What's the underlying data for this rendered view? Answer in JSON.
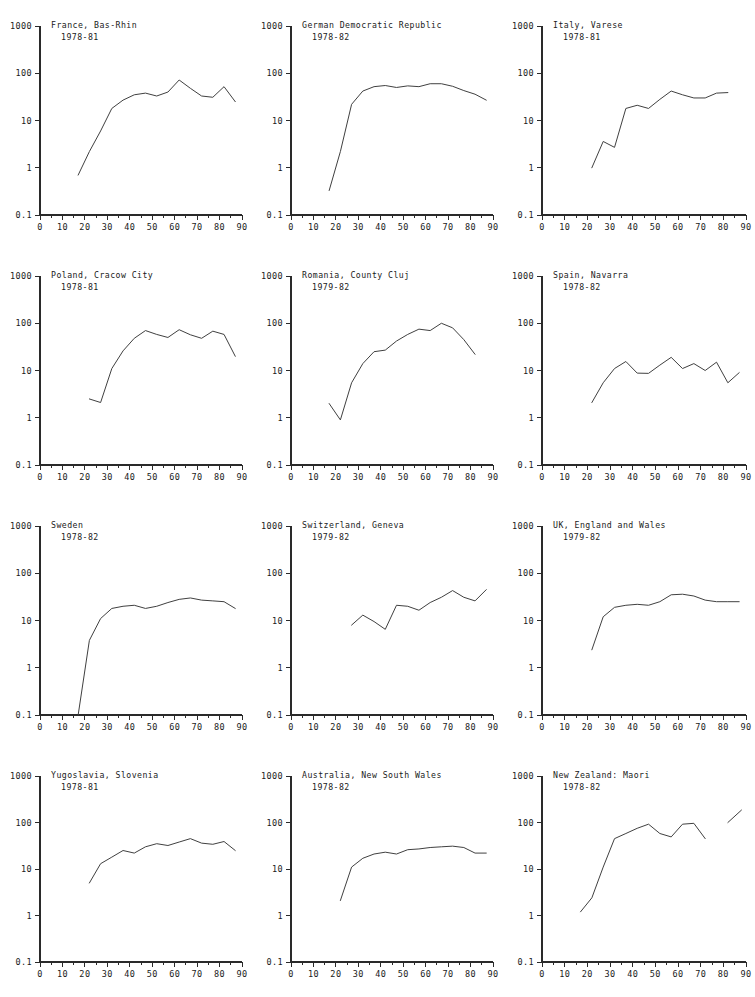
{
  "figure": {
    "type": "multi-panel-line-chart",
    "panel_count": 12,
    "layout": "3 columns x 4 rows",
    "y_scale": "log",
    "y_ticks": [
      "1000",
      "100",
      "10",
      "1",
      "0.1"
    ],
    "y_tick_values": [
      1000,
      100,
      10,
      1,
      0.1
    ],
    "x_ticks": [
      "0",
      "10",
      "20",
      "30",
      "40",
      "50",
      "60",
      "70",
      "80",
      "90"
    ],
    "x_tick_values": [
      0,
      10,
      20,
      30,
      40,
      50,
      60,
      70,
      80,
      90
    ],
    "x_minor_step": 5,
    "xlim": [
      0,
      90
    ],
    "ylim": [
      0.1,
      1000
    ],
    "line_color": "#404040",
    "axis_color": "#2a2a2a",
    "background": "#ffffff"
  },
  "chart_data": [
    {
      "type": "line",
      "title": "France, Bas-Rhin",
      "subtitle": "1978-81",
      "xlabel": "",
      "ylabel": "",
      "yscale": "log",
      "xlim": [
        0,
        90
      ],
      "ylim": [
        0.1,
        1000
      ],
      "x": [
        17,
        22,
        27,
        32,
        37,
        42,
        47,
        52,
        57,
        62,
        67,
        72,
        77,
        82,
        87
      ],
      "values": [
        0.7,
        2.2,
        6.0,
        18.0,
        27.0,
        35.0,
        38.0,
        33.0,
        40.0,
        72.0,
        48.0,
        33.0,
        31.0,
        52.0,
        25.0
      ]
    },
    {
      "type": "line",
      "title": "German Democratic Republic",
      "subtitle": "1978-82",
      "xlabel": "",
      "ylabel": "",
      "yscale": "log",
      "xlim": [
        0,
        90
      ],
      "ylim": [
        0.1,
        1000
      ],
      "x": [
        17,
        22,
        27,
        32,
        37,
        42,
        47,
        52,
        57,
        62,
        67,
        72,
        77,
        82,
        87
      ],
      "values": [
        0.33,
        2.2,
        22.0,
        42.0,
        52.0,
        55.0,
        50.0,
        54.0,
        52.0,
        60.0,
        60.0,
        53.0,
        43.0,
        36.0,
        27.0
      ]
    },
    {
      "type": "line",
      "title": "Italy, Varese",
      "subtitle": "1978-81",
      "xlabel": "",
      "ylabel": "",
      "yscale": "log",
      "xlim": [
        0,
        90
      ],
      "ylim": [
        0.1,
        1000
      ],
      "x": [
        22,
        27,
        32,
        37,
        42,
        47,
        52,
        57,
        62,
        67,
        72,
        77,
        82
      ],
      "values": [
        1.0,
        3.6,
        2.7,
        18.0,
        21.0,
        18.0,
        28.0,
        42.0,
        35.0,
        30.0,
        30.0,
        38.0,
        39.0
      ]
    },
    {
      "type": "line",
      "title": "Poland, Cracow City",
      "subtitle": "1978-81",
      "xlabel": "",
      "ylabel": "",
      "yscale": "log",
      "xlim": [
        0,
        90
      ],
      "ylim": [
        0.1,
        1000
      ],
      "x": [
        22,
        27,
        32,
        37,
        42,
        47,
        52,
        57,
        62,
        67,
        72,
        77,
        82,
        87
      ],
      "values": [
        2.5,
        2.1,
        11.0,
        26.0,
        48.0,
        70.0,
        58.0,
        50.0,
        73.0,
        57.0,
        48.0,
        68.0,
        58.0,
        20.0
      ]
    },
    {
      "type": "line",
      "title": "Romania, County Cluj",
      "subtitle": "1979-82",
      "xlabel": "",
      "ylabel": "",
      "yscale": "log",
      "xlim": [
        0,
        90
      ],
      "ylim": [
        0.1,
        1000
      ],
      "x": [
        17,
        22,
        27,
        32,
        37,
        42,
        47,
        52,
        57,
        62,
        67,
        72,
        77,
        82
      ],
      "values": [
        2.0,
        0.9,
        5.5,
        14.0,
        25.0,
        27.0,
        42.0,
        58.0,
        75.0,
        70.0,
        100.0,
        80.0,
        45.0,
        22.0
      ]
    },
    {
      "type": "line",
      "title": "Spain, Navarra",
      "subtitle": "1978-82",
      "xlabel": "",
      "ylabel": "",
      "yscale": "log",
      "xlim": [
        0,
        90
      ],
      "ylim": [
        0.1,
        1000
      ],
      "x": [
        22,
        27,
        32,
        37,
        42,
        47,
        52,
        57,
        62,
        67,
        72,
        77,
        82,
        87
      ],
      "values": [
        2.1,
        5.5,
        11.0,
        15.5,
        8.8,
        8.7,
        13.0,
        19.0,
        11.0,
        14.0,
        10.0,
        15.0,
        5.5,
        9.0
      ]
    },
    {
      "type": "line",
      "title": "Sweden",
      "subtitle": "1978-82",
      "xlabel": "",
      "ylabel": "",
      "yscale": "log",
      "xlim": [
        0,
        90
      ],
      "ylim": [
        0.1,
        1000
      ],
      "x": [
        17,
        22,
        27,
        32,
        37,
        42,
        47,
        52,
        57,
        62,
        67,
        72,
        77,
        82,
        87
      ],
      "values": [
        0.1,
        3.8,
        11.0,
        18.0,
        20.0,
        21.0,
        18.0,
        20.0,
        24.0,
        28.0,
        30.0,
        27.0,
        26.0,
        25.0,
        18.0
      ]
    },
    {
      "type": "line",
      "title": "Switzerland, Geneva",
      "subtitle": "1979-82",
      "xlabel": "",
      "ylabel": "",
      "yscale": "log",
      "xlim": [
        0,
        90
      ],
      "ylim": [
        0.1,
        1000
      ],
      "x": [
        27,
        32,
        37,
        42,
        47,
        52,
        57,
        62,
        67,
        72,
        77,
        82,
        87
      ],
      "values": [
        8.0,
        13.0,
        9.5,
        6.5,
        21.0,
        20.0,
        16.5,
        24.0,
        31.0,
        43.0,
        31.0,
        26.0,
        45.0
      ]
    },
    {
      "type": "line",
      "title": "UK, England and Wales",
      "subtitle": "1979-82",
      "xlabel": "",
      "ylabel": "",
      "yscale": "log",
      "xlim": [
        0,
        90
      ],
      "ylim": [
        0.1,
        1000
      ],
      "x": [
        22,
        27,
        32,
        37,
        42,
        47,
        52,
        57,
        62,
        67,
        72,
        77,
        82,
        87
      ],
      "values": [
        2.4,
        12.0,
        19.0,
        21.0,
        22.0,
        21.0,
        25.0,
        35.0,
        36.0,
        33.0,
        27.0,
        25.0,
        25.0,
        25.0
      ]
    },
    {
      "type": "line",
      "title": "Yugoslavia, Slovenia",
      "subtitle": "1978-81",
      "xlabel": "",
      "ylabel": "",
      "yscale": "log",
      "xlim": [
        0,
        90
      ],
      "ylim": [
        0.1,
        1000
      ],
      "x": [
        22,
        27,
        32,
        37,
        42,
        47,
        52,
        57,
        62,
        67,
        72,
        77,
        82,
        87
      ],
      "values": [
        5.0,
        13.0,
        18.0,
        25.0,
        22.0,
        30.0,
        35.0,
        32.0,
        38.0,
        45.0,
        36.0,
        34.0,
        39.0,
        25.0
      ]
    },
    {
      "type": "line",
      "title": "Australia, New South Wales",
      "subtitle": "1978-82",
      "xlabel": "",
      "ylabel": "",
      "yscale": "log",
      "xlim": [
        0,
        90
      ],
      "ylim": [
        0.1,
        1000
      ],
      "x": [
        22,
        27,
        32,
        37,
        42,
        47,
        52,
        57,
        62,
        67,
        72,
        77,
        82,
        87
      ],
      "values": [
        2.1,
        11.0,
        17.0,
        21.0,
        23.0,
        21.0,
        26.0,
        27.0,
        29.0,
        30.0,
        31.0,
        29.0,
        22.0,
        22.0
      ]
    },
    {
      "type": "line",
      "title": "New Zealand: Maori",
      "subtitle": "1978-82",
      "xlabel": "",
      "ylabel": "",
      "yscale": "log",
      "xlim": [
        0,
        90
      ],
      "ylim": [
        0.1,
        1000
      ],
      "x": [
        17,
        22,
        27,
        32,
        37,
        42,
        47,
        52,
        57,
        62,
        67,
        72
      ],
      "values": [
        1.2,
        2.4,
        11.0,
        45.0,
        58.0,
        75.0,
        92.0,
        58.0,
        49.0,
        92.0,
        96.0,
        45.0
      ],
      "extra_segment": {
        "x": [
          82,
          88
        ],
        "values": [
          100.0,
          185.0
        ]
      }
    }
  ]
}
